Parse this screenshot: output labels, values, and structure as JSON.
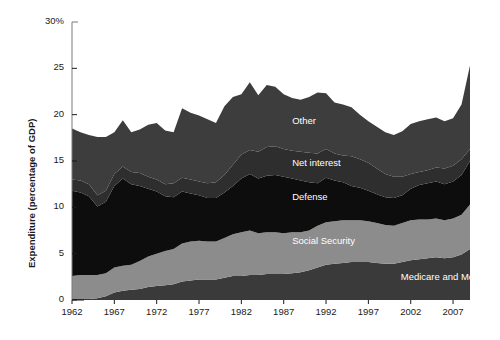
{
  "chart_data": {
    "type": "area",
    "stacked": true,
    "title": "",
    "xlabel": "",
    "ylabel": "Expenditure (percentage of GDP)",
    "ylim": [
      0,
      30
    ],
    "xlim": [
      1962,
      2009
    ],
    "grid": false,
    "legend_position": "inline-labels",
    "ytick_labels": [
      "30%",
      "25",
      "20",
      "15",
      "10",
      "5",
      "0"
    ],
    "ytick_values": [
      30,
      25,
      20,
      15,
      10,
      5,
      0
    ],
    "xtick_labels": [
      "1962",
      "1967",
      "1972",
      "1977",
      "1982",
      "1987",
      "1992",
      "1997",
      "2002",
      "2007"
    ],
    "xtick_values": [
      1962,
      1967,
      1972,
      1977,
      1982,
      1987,
      1992,
      1997,
      2002,
      2007
    ],
    "x": [
      1962,
      1963,
      1964,
      1965,
      1966,
      1967,
      1968,
      1969,
      1970,
      1971,
      1972,
      1973,
      1974,
      1975,
      1976,
      1977,
      1978,
      1979,
      1980,
      1981,
      1982,
      1983,
      1984,
      1985,
      1986,
      1987,
      1988,
      1989,
      1990,
      1991,
      1992,
      1993,
      1994,
      1995,
      1996,
      1997,
      1998,
      1999,
      2000,
      2001,
      2002,
      2003,
      2004,
      2005,
      2006,
      2007,
      2008,
      2009
    ],
    "series": [
      {
        "name": "Medicare and Medicaid",
        "color": "#3a3a3a",
        "stack_order": 1,
        "values": [
          0.1,
          0.1,
          0.1,
          0.2,
          0.4,
          0.8,
          1.0,
          1.1,
          1.2,
          1.4,
          1.5,
          1.6,
          1.7,
          2.0,
          2.1,
          2.2,
          2.2,
          2.2,
          2.4,
          2.6,
          2.6,
          2.7,
          2.7,
          2.8,
          2.8,
          2.8,
          2.9,
          3.0,
          3.2,
          3.5,
          3.8,
          3.9,
          4.0,
          4.1,
          4.1,
          4.1,
          4.0,
          3.9,
          3.9,
          4.1,
          4.3,
          4.4,
          4.5,
          4.6,
          4.5,
          4.6,
          4.9,
          5.5
        ]
      },
      {
        "name": "Social Security",
        "color": "#8c8c8c",
        "stack_order": 2,
        "values": [
          2.5,
          2.6,
          2.6,
          2.5,
          2.5,
          2.7,
          2.7,
          2.7,
          3.0,
          3.3,
          3.5,
          3.7,
          3.8,
          4.1,
          4.2,
          4.2,
          4.1,
          4.1,
          4.3,
          4.5,
          4.7,
          4.8,
          4.5,
          4.5,
          4.5,
          4.4,
          4.4,
          4.3,
          4.3,
          4.5,
          4.6,
          4.6,
          4.6,
          4.5,
          4.5,
          4.4,
          4.3,
          4.2,
          4.1,
          4.2,
          4.3,
          4.3,
          4.2,
          4.2,
          4.1,
          4.2,
          4.3,
          4.8
        ]
      },
      {
        "name": "Defense",
        "color": "#0d0d0d",
        "stack_order": 3,
        "values": [
          9.2,
          8.9,
          8.5,
          7.4,
          7.7,
          8.8,
          9.4,
          8.7,
          8.1,
          7.3,
          6.7,
          5.9,
          5.6,
          5.6,
          5.2,
          4.9,
          4.7,
          4.7,
          4.9,
          5.2,
          5.8,
          6.1,
          5.9,
          6.1,
          6.2,
          6.1,
          5.8,
          5.6,
          5.2,
          4.6,
          4.8,
          4.4,
          4.1,
          3.7,
          3.5,
          3.3,
          3.1,
          3.0,
          3.0,
          3.0,
          3.4,
          3.7,
          3.9,
          4.0,
          3.9,
          4.0,
          4.3,
          4.7
        ]
      },
      {
        "name": "Net interest",
        "color": "#2e2e2e",
        "stack_order": 4,
        "values": [
          1.2,
          1.3,
          1.3,
          1.2,
          1.2,
          1.3,
          1.3,
          1.3,
          1.4,
          1.3,
          1.3,
          1.3,
          1.5,
          1.5,
          1.5,
          1.5,
          1.6,
          1.7,
          1.9,
          2.3,
          2.6,
          2.6,
          2.9,
          3.1,
          3.1,
          3.0,
          3.0,
          3.1,
          3.2,
          3.2,
          3.1,
          2.9,
          2.9,
          3.2,
          3.1,
          3.0,
          2.8,
          2.5,
          2.3,
          2.0,
          1.6,
          1.4,
          1.4,
          1.5,
          1.7,
          1.7,
          1.7,
          1.3
        ]
      },
      {
        "name": "Other",
        "color": "#3d3d3d",
        "stack_order": 5,
        "values": [
          5.5,
          5.2,
          5.3,
          6.3,
          5.8,
          4.5,
          5.0,
          4.3,
          4.7,
          5.6,
          6.1,
          5.8,
          5.5,
          7.5,
          7.2,
          7.1,
          6.9,
          6.4,
          7.4,
          7.3,
          6.5,
          7.3,
          6.1,
          6.7,
          6.4,
          5.9,
          5.7,
          5.6,
          6.0,
          6.6,
          6.0,
          5.5,
          5.5,
          5.3,
          4.8,
          4.5,
          4.5,
          4.5,
          4.5,
          4.9,
          5.4,
          5.5,
          5.5,
          5.4,
          5.1,
          5.1,
          5.9,
          9.0
        ]
      }
    ],
    "series_label_positions": [
      {
        "name": "Other",
        "x": 1988,
        "y": 19.2
      },
      {
        "name": "Net interest",
        "x": 1988,
        "y": 14.7
      },
      {
        "name": "Defense",
        "x": 1988,
        "y": 11.0
      },
      {
        "name": "Social Security",
        "x": 1988,
        "y": 6.3
      },
      {
        "name": "Medicare and Medicaid",
        "x": 2002,
        "y": 2.4
      }
    ]
  },
  "axis": {
    "y_title": "Expenditure (percentage of GDP)",
    "spine_color": "#7a7a7a"
  },
  "labels": {
    "other": "Other",
    "net_interest": "Net interest",
    "defense": "Defense",
    "social_security": "Social Security",
    "medicare_medicaid": "Medicare and Medicaid"
  }
}
